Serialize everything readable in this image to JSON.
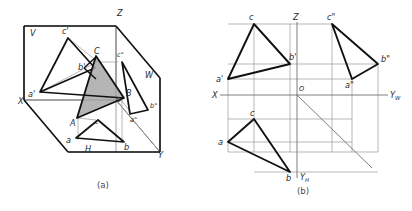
{
  "figure": {
    "panels": [
      {
        "id": "a",
        "caption": "(a)",
        "description": "Pictorial view of the three mutually perpendicular projection planes V, H and W with triangle ABC and its three projections",
        "axis_labels": [
          {
            "name": "X",
            "text": "X",
            "x": 18,
            "y": 104
          },
          {
            "name": "Y",
            "text": "Y",
            "x": 158,
            "y": 158
          },
          {
            "name": "Z",
            "text": "Z",
            "x": 117,
            "y": 16
          },
          {
            "name": "V",
            "text": "V",
            "x": 30,
            "y": 32
          },
          {
            "name": "H",
            "text": "H",
            "x": 85,
            "y": 152
          },
          {
            "name": "W",
            "text": "W",
            "x": 145,
            "y": 75
          },
          {
            "name": "O",
            "text": "O",
            "x": 116,
            "y": 100
          }
        ],
        "point_labels": [
          {
            "name": "A",
            "text": "A",
            "x": 72,
            "y": 122
          },
          {
            "name": "B",
            "text": "B",
            "x": 126,
            "y": 95
          },
          {
            "name": "C",
            "text": "C",
            "x": 96,
            "y": 56
          },
          {
            "name": "a-prime",
            "text": "a'",
            "x": 31,
            "y": 95
          },
          {
            "name": "b-prime",
            "text": "b'",
            "x": 83,
            "y": 72
          },
          {
            "name": "c-prime",
            "text": "c'",
            "x": 64,
            "y": 36
          },
          {
            "name": "a-dblprime",
            "text": "a\"",
            "x": 134,
            "y": 119
          },
          {
            "name": "b-dblprime",
            "text": "b\"",
            "x": 152,
            "y": 106
          },
          {
            "name": "c-dblprime",
            "text": "c\"",
            "x": 119,
            "y": 58
          },
          {
            "name": "a",
            "text": "a",
            "x": 68,
            "y": 141
          },
          {
            "name": "b",
            "text": "b",
            "x": 126,
            "y": 146
          },
          {
            "name": "c",
            "text": "c",
            "x": 95,
            "y": 124
          }
        ]
      },
      {
        "id": "b",
        "caption": "(b)",
        "description": "Unfolded orthographic layout: frontal, horizontal and profile projections of triangle abc around the origin O",
        "axis_labels": [
          {
            "name": "X",
            "text": "X",
            "x": 8,
            "y": 97
          },
          {
            "name": "Z",
            "text": "Z",
            "x": 89,
            "y": 20
          },
          {
            "name": "O",
            "text": "O",
            "x": 95,
            "y": 90
          },
          {
            "name": "YW",
            "text": "Y",
            "x": 186,
            "y": 97,
            "sub": "W"
          },
          {
            "name": "YH",
            "text": "Y",
            "x": 97,
            "y": 180,
            "sub": "H"
          }
        ],
        "point_labels": [
          {
            "name": "c-front",
            "text": "c",
            "x": 44,
            "y": 27
          },
          {
            "name": "b-prime",
            "text": "b'",
            "x": 85,
            "y": 62
          },
          {
            "name": "a-prime",
            "text": "a'",
            "x": 20,
            "y": 80
          },
          {
            "name": "c-dblprime",
            "text": "c\"",
            "x": 122,
            "y": 27
          },
          {
            "name": "b-dblprime",
            "text": "b\"",
            "x": 168,
            "y": 62
          },
          {
            "name": "a-dblprime",
            "text": "a\"",
            "x": 142,
            "y": 81
          },
          {
            "name": "c-top",
            "text": "c",
            "x": 45,
            "y": 122
          },
          {
            "name": "a-top",
            "text": "a",
            "x": 20,
            "y": 146
          },
          {
            "name": "b-top",
            "text": "b",
            "x": 82,
            "y": 176
          }
        ]
      }
    ],
    "colors": {
      "stroke_heavy": "#111111",
      "stroke_light": "#8c8c8c",
      "shade_fill": "#a8a8a8",
      "text": "#2b2b2b",
      "background": "#ffffff"
    }
  }
}
